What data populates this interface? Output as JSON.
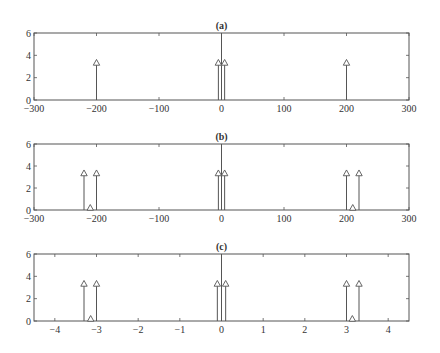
{
  "chart_data": [
    {
      "type": "stem",
      "title": "(a)",
      "xlim": [
        -300,
        300
      ],
      "ylim": [
        0,
        6
      ],
      "xticks": [
        -300,
        -200,
        -100,
        0,
        100,
        200,
        300
      ],
      "xtick_labels": [
        "−300",
        "−200",
        "−100",
        "0",
        "100",
        "200",
        "300"
      ],
      "yticks": [
        0,
        2,
        4,
        6
      ],
      "ytick_labels": [
        "0",
        "2",
        "4",
        "6"
      ],
      "marker": "triangle-up",
      "zero_line": true,
      "points": [
        {
          "x": -200,
          "y": 3.14
        },
        {
          "x": -5,
          "y": 3.14
        },
        {
          "x": 5,
          "y": 3.14
        },
        {
          "x": 200,
          "y": 3.14
        }
      ]
    },
    {
      "type": "stem",
      "title": "(b)",
      "xlim": [
        -300,
        300
      ],
      "ylim": [
        0,
        6
      ],
      "xticks": [
        -300,
        -200,
        -100,
        0,
        100,
        200,
        300
      ],
      "xtick_labels": [
        "−300",
        "−200",
        "−100",
        "0",
        "100",
        "200",
        "300"
      ],
      "yticks": [
        0,
        2,
        4,
        6
      ],
      "ytick_labels": [
        "0",
        "2",
        "4",
        "6"
      ],
      "marker": "triangle-up",
      "zero_line": true,
      "points": [
        {
          "x": -220,
          "y": 3.14
        },
        {
          "x": -210,
          "y": 0
        },
        {
          "x": -200,
          "y": 3.14
        },
        {
          "x": -5,
          "y": 3.14
        },
        {
          "x": 5,
          "y": 3.14
        },
        {
          "x": 200,
          "y": 3.14
        },
        {
          "x": 210,
          "y": 0
        },
        {
          "x": 220,
          "y": 3.14
        }
      ]
    },
    {
      "type": "stem",
      "title": "(c)",
      "xlim": [
        -4.5,
        4.5
      ],
      "ylim": [
        0,
        6
      ],
      "xticks": [
        -4,
        -3,
        -2,
        -1,
        0,
        1,
        2,
        3,
        4
      ],
      "xtick_labels": [
        "−4",
        "−3",
        "−2",
        "−1",
        "0",
        "1",
        "2",
        "3",
        "4"
      ],
      "yticks": [
        0,
        2,
        4,
        6
      ],
      "ytick_labels": [
        "0",
        "2",
        "4",
        "6"
      ],
      "marker": "triangle-up",
      "zero_line": true,
      "points": [
        {
          "x": -3.3,
          "y": 3.14
        },
        {
          "x": -3.14,
          "y": 0
        },
        {
          "x": -3.0,
          "y": 3.14
        },
        {
          "x": -0.1,
          "y": 3.14
        },
        {
          "x": 0.1,
          "y": 3.14
        },
        {
          "x": 3.0,
          "y": 3.14
        },
        {
          "x": 3.14,
          "y": 0
        },
        {
          "x": 3.3,
          "y": 3.14
        }
      ]
    }
  ]
}
